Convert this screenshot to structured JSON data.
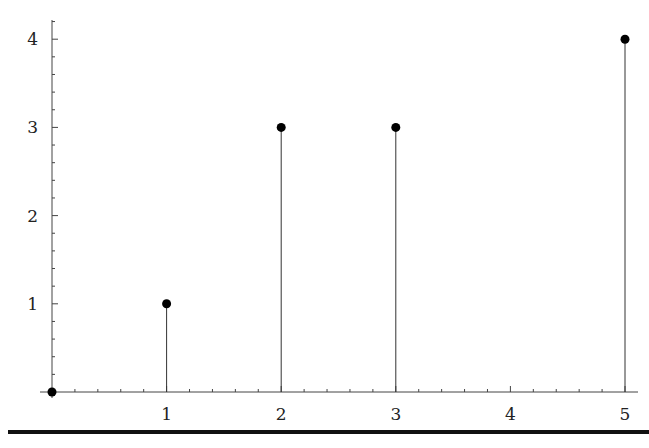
{
  "chart_data": {
    "type": "stem",
    "title": "",
    "xlabel": "",
    "ylabel": "",
    "x": [
      0,
      1,
      2,
      3,
      5
    ],
    "values": [
      0,
      1,
      3,
      3,
      4
    ],
    "xlim": [
      0,
      5.1
    ],
    "ylim": [
      0,
      4.2
    ],
    "x_ticks": [
      "1",
      "2",
      "3",
      "4",
      "5"
    ],
    "y_ticks": [
      "1",
      "2",
      "3",
      "4"
    ],
    "grid": false,
    "legend": null,
    "marker": "filled-circle",
    "color": "#000000"
  }
}
